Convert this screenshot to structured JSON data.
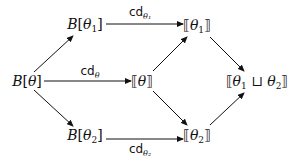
{
  "diagram": {
    "type": "commutative-diagram",
    "nodes": {
      "b_theta": {
        "id": "b_theta",
        "prefix": "B",
        "open": "[",
        "var": "θ",
        "sub": "",
        "close": "]",
        "x": 27,
        "y": 81
      },
      "b_theta1": {
        "id": "b_theta1",
        "prefix": "B",
        "open": "[",
        "var": "θ",
        "sub": "1",
        "close": "]",
        "x": 85,
        "y": 25
      },
      "b_theta2": {
        "id": "b_theta2",
        "prefix": "B",
        "open": "[",
        "var": "θ",
        "sub": "2",
        "close": "]",
        "x": 85,
        "y": 136
      },
      "sem_theta": {
        "id": "sem_theta",
        "prefix": "",
        "open": "⟦",
        "var": "θ",
        "sub": "",
        "close": "⟧",
        "x": 142,
        "y": 81
      },
      "sem_theta1": {
        "id": "sem_theta1",
        "prefix": "",
        "open": "⟦",
        "var": "θ",
        "sub": "1",
        "close": "⟧",
        "x": 197,
        "y": 26
      },
      "sem_theta2": {
        "id": "sem_theta2",
        "prefix": "",
        "open": "⟦",
        "var": "θ",
        "sub": "2",
        "close": "⟧",
        "x": 197,
        "y": 136
      },
      "sem_join": {
        "id": "sem_join",
        "text": "⟦θ₁ ⊔ θ₂⟧",
        "open": "⟦",
        "a": "θ",
        "a_sub": "1",
        "op": " ⊔ ",
        "b": "θ",
        "b_sub": "2",
        "close": "⟧",
        "x": 255,
        "y": 82
      }
    },
    "edges": [
      {
        "from": "b_theta",
        "to": "b_theta1",
        "label": ""
      },
      {
        "from": "b_theta",
        "to": "sem_theta",
        "label": "cd",
        "label_sub": "θ"
      },
      {
        "from": "b_theta",
        "to": "b_theta2",
        "label": ""
      },
      {
        "from": "b_theta1",
        "to": "sem_theta1",
        "label": "cd",
        "label_sub": "θ₁"
      },
      {
        "from": "b_theta2",
        "to": "sem_theta2",
        "label": "cd",
        "label_sub": "θ₂"
      },
      {
        "from": "sem_theta",
        "to": "sem_theta1",
        "label": ""
      },
      {
        "from": "sem_theta",
        "to": "sem_theta2",
        "label": ""
      },
      {
        "from": "sem_theta1",
        "to": "sem_join",
        "label": ""
      },
      {
        "from": "sem_theta2",
        "to": "sem_join",
        "label": ""
      }
    ],
    "labels": {
      "cd_theta": {
        "base": "cd",
        "sub": "θ",
        "x": 90,
        "y": 71
      },
      "cd_theta1": {
        "base": "cd",
        "sub": "θ₁",
        "x": 138,
        "y": 13
      },
      "cd_theta2": {
        "base": "cd",
        "sub": "θ₂",
        "x": 138,
        "y": 150
      }
    },
    "colors": {
      "stroke": "#111111",
      "background": "#ffffff"
    }
  }
}
